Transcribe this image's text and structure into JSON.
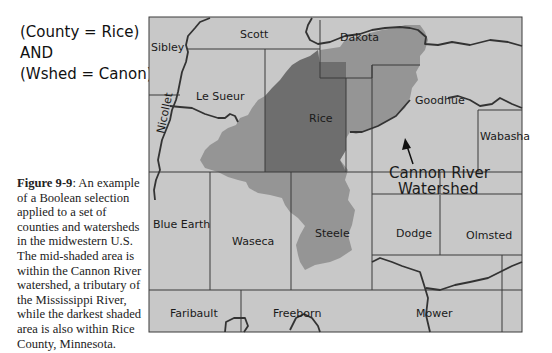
{
  "query": {
    "line1": "(County = Rice)",
    "line2": "AND",
    "line3": "(Wshed = Canon)"
  },
  "caption": {
    "label": "Figure 9-9",
    "text": ": An example of a Boolean selection applied to a set of counties and watersheds in the midwestern U.S. The mid-shaded area is within the Cannon River watershed, a tributary of the Mississippi River, while the darkest shaded area is also within Rice County, Minnesota."
  },
  "map": {
    "colors": {
      "background": "#c8c8c8",
      "watershed": "#959595",
      "rice_in_watershed": "#6e6e6e",
      "boundary": "#3a3a3a",
      "river": "#333333"
    },
    "counties": {
      "scott": "Scott",
      "dakota": "Dakota",
      "sibley": "Sibley",
      "nicollet": "Nicollet",
      "le_sueur": "Le Sueur",
      "rice": "Rice",
      "goodhue": "Goodhue",
      "wabasha": "Wabasha",
      "blue_earth": "Blue Earth",
      "waseca": "Waseca",
      "steele": "Steele",
      "dodge": "Dodge",
      "olmsted": "Olmsted",
      "faribault": "Faribault",
      "freeborn": "Freeborn",
      "mower": "Mower"
    },
    "annotation": {
      "line1": "Cannon River",
      "line2": "Watershed"
    }
  }
}
